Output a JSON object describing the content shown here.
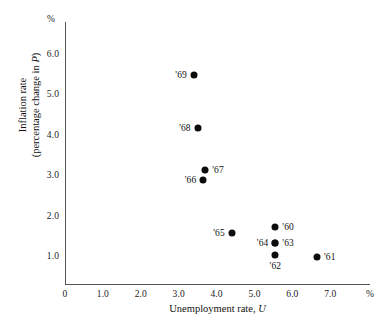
{
  "chart_data": {
    "type": "scatter",
    "title": "",
    "xlabel": "Unemployment rate, U",
    "ylabel": "Inflation rate (percentage change in P)",
    "ylabel_line1": "Inflation rate",
    "ylabel_line2_prefix": "(percentage change in ",
    "ylabel_line2_italic": "P",
    "ylabel_line2_suffix": ")",
    "xlabel_prefix": "Unemployment rate, ",
    "xlabel_italic": "U",
    "x_unit": "%",
    "y_unit": "%",
    "xlim": [
      0,
      7.6
    ],
    "ylim": [
      0,
      6.5
    ],
    "xticks": [
      "0",
      "1.0",
      "2.0",
      "3.0",
      "4.0",
      "5.0",
      "6.0",
      "7.0"
    ],
    "xtick_values": [
      0,
      1,
      2,
      3,
      4,
      5,
      6,
      7
    ],
    "yticks": [
      "1.0",
      "2.0",
      "3.0",
      "4.0",
      "5.0",
      "6.0"
    ],
    "ytick_values": [
      1,
      2,
      3,
      4,
      5,
      6
    ],
    "grid": false,
    "legend": "none",
    "marker_color": "#0c0c0c",
    "axis_color": "#55544f",
    "points": [
      {
        "label": "'60",
        "x": 5.55,
        "y": 1.75,
        "label_pos": "right"
      },
      {
        "label": "'61",
        "x": 6.65,
        "y": 1.0,
        "label_pos": "right"
      },
      {
        "label": "'62",
        "x": 5.55,
        "y": 1.05,
        "label_pos": "below"
      },
      {
        "label": "'63",
        "x": 5.55,
        "y": 1.35,
        "label_pos": "right"
      },
      {
        "label": "'64",
        "x": 5.55,
        "y": 1.35,
        "label_pos": "left"
      },
      {
        "label": "'65",
        "x": 4.4,
        "y": 1.6,
        "label_pos": "left"
      },
      {
        "label": "'66",
        "x": 3.65,
        "y": 2.9,
        "label_pos": "left"
      },
      {
        "label": "'67",
        "x": 3.7,
        "y": 3.15,
        "label_pos": "right"
      },
      {
        "label": "'68",
        "x": 3.5,
        "y": 4.2,
        "label_pos": "left"
      },
      {
        "label": "'69",
        "x": 3.4,
        "y": 5.5,
        "label_pos": "left"
      }
    ]
  }
}
